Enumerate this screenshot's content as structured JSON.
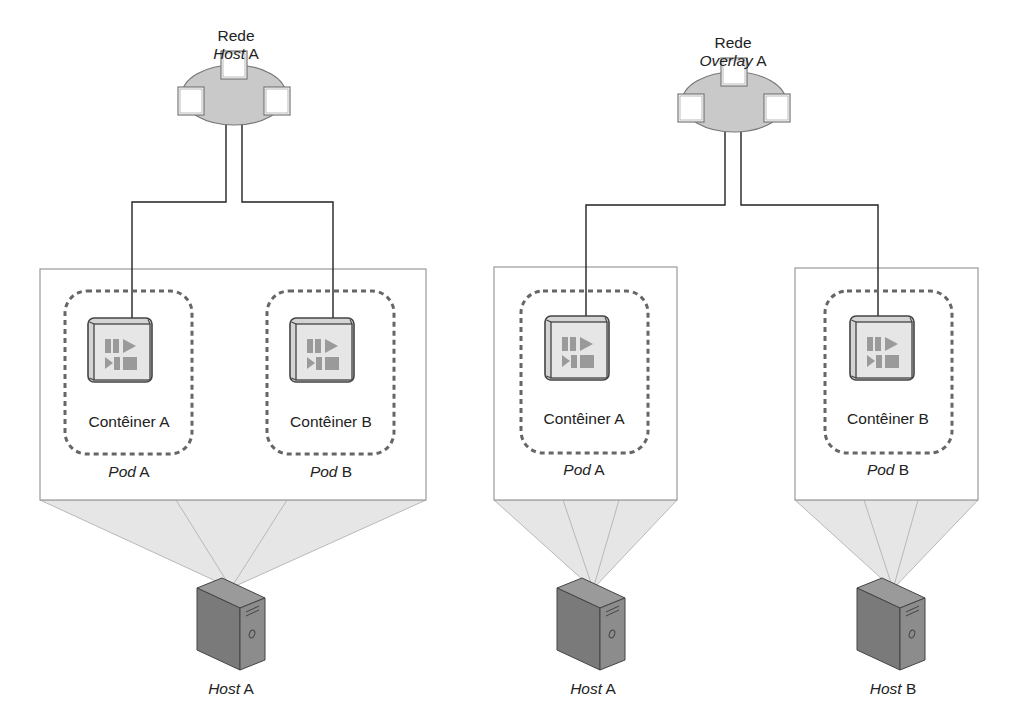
{
  "left_scenario": {
    "network": {
      "line1": "Rede",
      "line2_italic": "Host",
      "line2_suffix": " A"
    },
    "pods": [
      {
        "container_label": "Contêiner A",
        "pod_italic": "Pod",
        "pod_suffix": " A"
      },
      {
        "container_label": "Contêiner B",
        "pod_italic": "Pod",
        "pod_suffix": " B"
      }
    ],
    "hosts": [
      {
        "italic": "Host",
        "suffix": " A"
      }
    ]
  },
  "right_scenario": {
    "network": {
      "line1": "Rede",
      "line2_italic": "Overlay",
      "line2_suffix": " A"
    },
    "pods": [
      {
        "container_label": "Contêiner A",
        "pod_italic": "Pod",
        "pod_suffix": " A"
      },
      {
        "container_label": "Contêiner B",
        "pod_italic": "Pod",
        "pod_suffix": " B"
      }
    ],
    "hosts": [
      {
        "italic": "Host",
        "suffix": " A"
      },
      {
        "italic": "Host",
        "suffix": " B"
      }
    ]
  },
  "icons": {
    "network_cloud": "network-cloud-icon",
    "container": "container-icon",
    "server": "server-tower-icon"
  },
  "colors": {
    "line": "#222222",
    "box_border": "#9a9a9a",
    "pod_dash": "#666666",
    "cloud_fill": "#c9c9c9",
    "projection_fill": "#e6e6e6",
    "server_fill": "#7f7f7f",
    "container_face": "#e4e4e4",
    "container_glyph": "#9a9a9a"
  }
}
